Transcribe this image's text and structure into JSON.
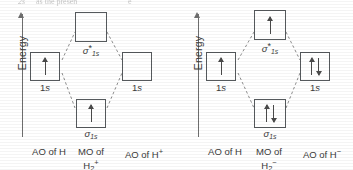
{
  "page": {
    "top_bleed_fragments": [
      "2s",
      "as the presen",
      "e"
    ]
  },
  "diagrams": [
    {
      "id": "h2-plus",
      "axis_label": "Energy",
      "left_ao": {
        "orbital_label": "1s",
        "electrons": [
          "up"
        ]
      },
      "right_ao": {
        "orbital_label": "1s",
        "electrons": []
      },
      "antibonding_mo": {
        "symbol": "σ",
        "star": "*",
        "subscript": "1s",
        "electrons": []
      },
      "bonding_mo": {
        "symbol": "σ",
        "star": "",
        "subscript": "1s",
        "electrons": [
          "up"
        ]
      },
      "captions": {
        "left": "AO of H",
        "center_line1": "MO of",
        "center_line2_base": "H",
        "center_line2_sub": "2",
        "center_line2_sup": "+",
        "right_base": "AO of H",
        "right_sup": "+"
      }
    },
    {
      "id": "h2-minus",
      "axis_label": "Energy",
      "left_ao": {
        "orbital_label": "1s",
        "electrons": [
          "up"
        ]
      },
      "right_ao": {
        "orbital_label": "1s",
        "electrons": [
          "up",
          "down"
        ]
      },
      "antibonding_mo": {
        "symbol": "σ",
        "star": "*",
        "subscript": "1s",
        "electrons": [
          "up"
        ]
      },
      "bonding_mo": {
        "symbol": "σ",
        "star": "",
        "subscript": "1s",
        "electrons": [
          "up",
          "down"
        ]
      },
      "captions": {
        "left": "AO of H",
        "center_line1": "MO of",
        "center_line2_base": "H",
        "center_line2_sub": "2",
        "center_line2_sup": "−",
        "right_base": "AO of H",
        "right_sup": "−"
      }
    }
  ],
  "colors": {
    "ink": "#3a3a3a",
    "box_stroke": "#55595c",
    "dashed_line": "#8c8c8c",
    "axis": "#6e6e6e",
    "background": "#ffffff"
  }
}
